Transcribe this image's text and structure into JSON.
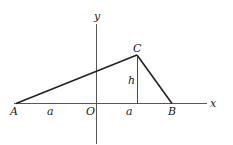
{
  "diagram": {
    "type": "geometry",
    "colors": {
      "stroke": "#222222",
      "axis": "#444444",
      "background": "#ffffff"
    },
    "axes": {
      "x_label": "x",
      "y_label": "y",
      "origin_label": "O"
    },
    "vertices": {
      "A": "A",
      "B": "B",
      "C": "C"
    },
    "segments": {
      "left_length_label": "a",
      "right_length_label": "a",
      "height_label": "h"
    }
  }
}
